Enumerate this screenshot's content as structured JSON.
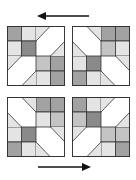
{
  "figure": {
    "colors": {
      "white": "#ffffff",
      "light": "#e4e4e4",
      "medium": "#c4c4c4",
      "dark": "#a2a2a2",
      "darker": "#8a8a8a",
      "line": "#333333",
      "arrow": "#111111"
    },
    "arrows": [
      {
        "name": "top-arrow",
        "direction": "left"
      },
      {
        "name": "bottom-arrow",
        "direction": "right"
      }
    ],
    "blocks": [
      {
        "name": "block-top-left",
        "squares": [
          [
            0,
            0,
            "dark"
          ],
          [
            15,
            0,
            "light"
          ],
          [
            0,
            15,
            "light"
          ],
          [
            15,
            15,
            "darker"
          ],
          [
            30,
            30,
            "medium"
          ],
          [
            45,
            30,
            "dark"
          ],
          [
            30,
            45,
            "light"
          ],
          [
            45,
            45,
            "dark"
          ]
        ],
        "triangles": [
          [
            [
              30,
              0
            ],
            [
              45,
              0
            ],
            [
              30,
              15
            ],
            "light"
          ],
          [
            [
              60,
              30
            ],
            [
              60,
              15
            ],
            [
              45,
              30
            ],
            "light"
          ],
          [
            [
              0,
              30
            ],
            [
              15,
              30
            ],
            [
              0,
              45
            ],
            "light"
          ],
          [
            [
              30,
              60
            ],
            [
              15,
              60
            ],
            [
              30,
              45
            ],
            "light"
          ]
        ],
        "diagonals": [
          [
            30,
            15,
            45,
            0
          ],
          [
            45,
            30,
            60,
            15
          ],
          [
            0,
            45,
            15,
            30
          ],
          [
            15,
            60,
            30,
            45
          ]
        ]
      },
      {
        "name": "block-top-right",
        "squares": [
          [
            30,
            0,
            "dark"
          ],
          [
            45,
            0,
            "dark"
          ],
          [
            30,
            15,
            "medium"
          ],
          [
            45,
            15,
            "light"
          ],
          [
            15,
            30,
            "darker"
          ],
          [
            0,
            30,
            "light"
          ],
          [
            0,
            45,
            "dark"
          ],
          [
            15,
            45,
            "light"
          ]
        ],
        "triangles": [
          [
            [
              15,
              0
            ],
            [
              30,
              0
            ],
            [
              30,
              15
            ],
            "light"
          ],
          [
            [
              0,
              15
            ],
            [
              0,
              30
            ],
            [
              15,
              30
            ],
            "light"
          ],
          [
            [
              45,
              30
            ],
            [
              60,
              30
            ],
            [
              60,
              45
            ],
            "light"
          ],
          [
            [
              30,
              45
            ],
            [
              30,
              60
            ],
            [
              45,
              60
            ],
            "light"
          ]
        ],
        "diagonals": [
          [
            15,
            0,
            30,
            15
          ],
          [
            0,
            15,
            15,
            30
          ],
          [
            45,
            30,
            60,
            45
          ],
          [
            30,
            45,
            45,
            60
          ]
        ]
      },
      {
        "name": "block-bottom-left",
        "squares": [
          [
            30,
            0,
            "dark"
          ],
          [
            45,
            0,
            "dark"
          ],
          [
            30,
            15,
            "light"
          ],
          [
            45,
            15,
            "medium"
          ],
          [
            15,
            30,
            "darker"
          ],
          [
            0,
            30,
            "light"
          ],
          [
            0,
            45,
            "dark"
          ],
          [
            15,
            45,
            "light"
          ]
        ],
        "triangles": [
          [
            [
              15,
              0
            ],
            [
              30,
              0
            ],
            [
              30,
              15
            ],
            "light"
          ],
          [
            [
              0,
              15
            ],
            [
              0,
              30
            ],
            [
              15,
              30
            ],
            "light"
          ],
          [
            [
              45,
              30
            ],
            [
              60,
              30
            ],
            [
              60,
              45
            ],
            "light"
          ],
          [
            [
              30,
              45
            ],
            [
              30,
              60
            ],
            [
              45,
              60
            ],
            "light"
          ]
        ],
        "diagonals": [
          [
            15,
            0,
            30,
            15
          ],
          [
            0,
            15,
            15,
            30
          ],
          [
            45,
            30,
            60,
            45
          ],
          [
            30,
            45,
            45,
            60
          ]
        ]
      },
      {
        "name": "block-bottom-right",
        "squares": [
          [
            0,
            0,
            "dark"
          ],
          [
            15,
            0,
            "light"
          ],
          [
            0,
            15,
            "medium"
          ],
          [
            15,
            15,
            "darker"
          ],
          [
            30,
            30,
            "medium"
          ],
          [
            45,
            30,
            "medium"
          ],
          [
            30,
            45,
            "light"
          ],
          [
            45,
            45,
            "dark"
          ]
        ],
        "triangles": [
          [
            [
              30,
              0
            ],
            [
              45,
              0
            ],
            [
              30,
              15
            ],
            "light"
          ],
          [
            [
              60,
              30
            ],
            [
              60,
              15
            ],
            [
              45,
              30
            ],
            "light"
          ],
          [
            [
              0,
              30
            ],
            [
              15,
              30
            ],
            [
              0,
              45
            ],
            "light"
          ],
          [
            [
              30,
              60
            ],
            [
              15,
              60
            ],
            [
              30,
              45
            ],
            "light"
          ]
        ],
        "diagonals": [
          [
            30,
            15,
            45,
            0
          ],
          [
            45,
            30,
            60,
            15
          ],
          [
            0,
            45,
            15,
            30
          ],
          [
            15,
            60,
            30,
            45
          ]
        ]
      }
    ]
  }
}
